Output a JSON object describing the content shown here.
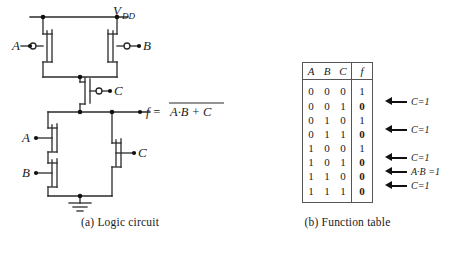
{
  "figure": {
    "parts": [
      {
        "id": "a",
        "caption": "(a)  Logic circuit"
      },
      {
        "id": "b",
        "caption": "(b)  Function table"
      }
    ]
  },
  "circuit": {
    "supply_label": "V",
    "supply_sub": "DD",
    "ground_label": "",
    "output_prefix": "f =",
    "output_expr": "A·B + C",
    "output_overline": true,
    "transistors": [
      {
        "name": "pmos-a",
        "type": "pmos",
        "gate_label": "A",
        "bubble": true
      },
      {
        "name": "pmos-b",
        "type": "pmos",
        "gate_label": "B",
        "bubble": true
      },
      {
        "name": "pmos-c",
        "type": "pmos",
        "gate_label": "C",
        "bubble": true
      },
      {
        "name": "nmos-a",
        "type": "nmos",
        "gate_label": "A",
        "bubble": false
      },
      {
        "name": "nmos-b",
        "type": "nmos",
        "gate_label": "B",
        "bubble": false
      },
      {
        "name": "nmos-c",
        "type": "nmos",
        "gate_label": "C",
        "bubble": false
      }
    ],
    "labels": {
      "A_top": "A",
      "B_top": "B",
      "C_mid": "C",
      "A_bot": "A",
      "B_bot": "B",
      "C_bot": "C"
    },
    "colors": {
      "wire": "#2a2a2a",
      "node": "#111111",
      "background": "#ffffff"
    }
  },
  "function_table": {
    "headers": [
      "A",
      "B",
      "C",
      "f"
    ],
    "rows": [
      {
        "a": "0",
        "b": "0",
        "c": "0",
        "f": "1",
        "bold": false,
        "note": ""
      },
      {
        "a": "0",
        "b": "0",
        "c": "1",
        "f": "0",
        "bold": true,
        "note": "C=1"
      },
      {
        "a": "0",
        "b": "1",
        "c": "0",
        "f": "1",
        "bold": false,
        "note": ""
      },
      {
        "a": "0",
        "b": "1",
        "c": "1",
        "f": "0",
        "bold": true,
        "note": "C=1"
      },
      {
        "a": "1",
        "b": "0",
        "c": "0",
        "f": "1",
        "bold": false,
        "note": ""
      },
      {
        "a": "1",
        "b": "0",
        "c": "1",
        "f": "0",
        "bold": true,
        "note": "C=1"
      },
      {
        "a": "1",
        "b": "1",
        "c": "0",
        "f": "0",
        "bold": true,
        "note": "A·B =1"
      },
      {
        "a": "1",
        "b": "1",
        "c": "1",
        "f": "0",
        "bold": true,
        "note": "C=1"
      }
    ],
    "annotations": [
      {
        "row": 1,
        "text": "C=1"
      },
      {
        "row": 3,
        "text": "C=1"
      },
      {
        "row": 5,
        "text": "C=1"
      },
      {
        "row": 6,
        "text": "A·B =1"
      },
      {
        "row": 7,
        "text": "C=1"
      }
    ]
  }
}
